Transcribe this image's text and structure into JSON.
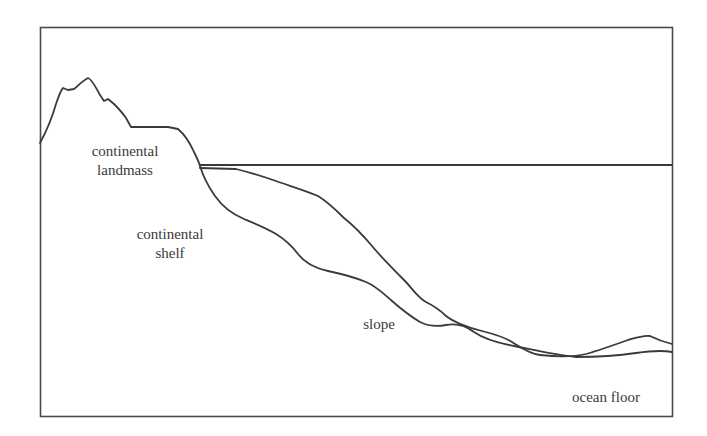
{
  "diagram": {
    "title": "",
    "labels": {
      "landmass_line1": "continental",
      "landmass_line2": "landmass",
      "shelf_line1": "continental",
      "shelf_line2": "shelf",
      "slope": "slope",
      "ocean_floor": "ocean floor"
    },
    "colors": {
      "line": "#3a3a3a",
      "background": "#ffffff"
    }
  }
}
